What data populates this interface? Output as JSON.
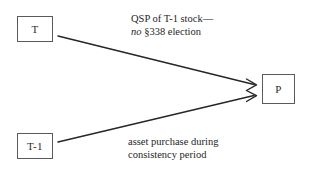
{
  "diagram": {
    "type": "flow-diagram",
    "background_color": "#ffffff",
    "line_color": "#262626",
    "box_border_color": "#5a5a5a",
    "text_color": "#262626",
    "nodes": [
      {
        "id": "t",
        "label": "T",
        "x": 17,
        "y": 16,
        "width": 36,
        "height": 26
      },
      {
        "id": "t1",
        "label": "T-1",
        "x": 17,
        "y": 133,
        "width": 36,
        "height": 26
      },
      {
        "id": "p",
        "label": "P",
        "x": 262,
        "y": 74,
        "width": 33,
        "height": 30
      }
    ],
    "edges": [
      {
        "id": "t-to-p",
        "from": "t",
        "to": "p",
        "start": [
          58,
          36
        ],
        "end": [
          257,
          85
        ],
        "arrowhead": "open-v",
        "caption_id": "qsp"
      },
      {
        "id": "t1-to-p",
        "from": "t1",
        "to": "p",
        "start": [
          58,
          142
        ],
        "end": [
          257,
          95
        ],
        "arrowhead": "open-v",
        "caption_id": "asset"
      }
    ],
    "captions": [
      {
        "id": "qsp",
        "line1": "QSP of T-1 stock—",
        "line2_italic": "no",
        "line2_rest": " §338 election"
      },
      {
        "id": "asset",
        "line1": "asset purchase during",
        "line2": "consistency period"
      }
    ]
  }
}
